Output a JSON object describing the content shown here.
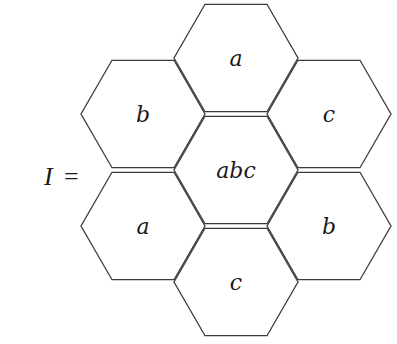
{
  "equation": {
    "lhs": "I",
    "op": "="
  },
  "hexagons": [
    {
      "id": "top",
      "label": "a",
      "cx": 236,
      "cy": 58
    },
    {
      "id": "upper-left",
      "label": "b",
      "cx": 143,
      "cy": 114
    },
    {
      "id": "upper-right",
      "label": "c",
      "cx": 329,
      "cy": 114
    },
    {
      "id": "center",
      "label": "abc",
      "cx": 236,
      "cy": 170
    },
    {
      "id": "lower-left",
      "label": "a",
      "cx": 143,
      "cy": 226
    },
    {
      "id": "lower-right",
      "label": "b",
      "cx": 329,
      "cy": 226
    },
    {
      "id": "bottom",
      "label": "c",
      "cx": 236,
      "cy": 282
    }
  ],
  "style": {
    "stroke": "#3a3a3a",
    "side": 62
  }
}
